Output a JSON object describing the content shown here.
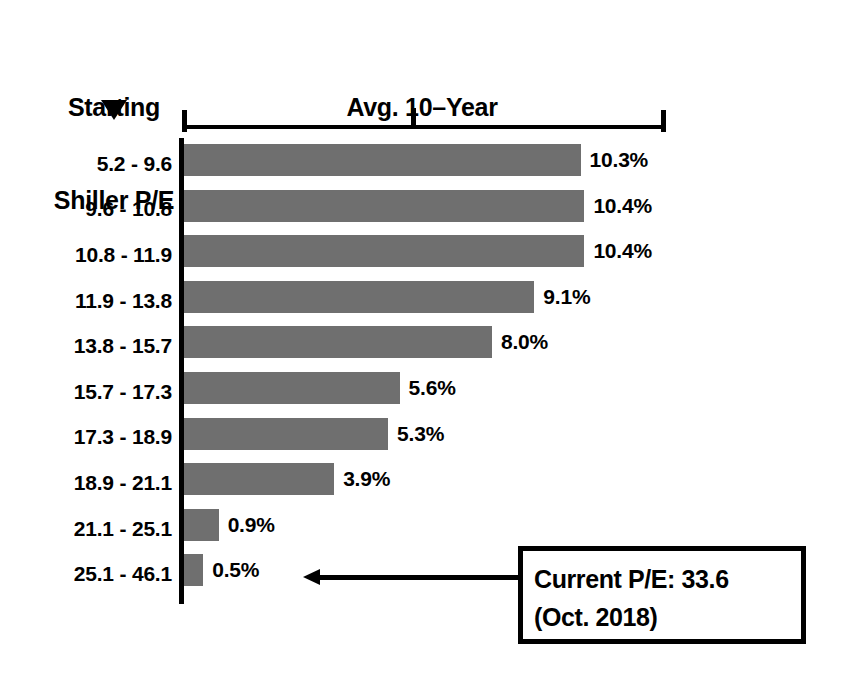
{
  "header": {
    "left_title_line1": "Starting",
    "left_title_line2": "Shiller P/E",
    "right_title_line1": "Avg. 10–Year",
    "right_title_line2": "Real Return",
    "marker_icon": "triangle-down-icon"
  },
  "callout": {
    "line1": "Current P/E: 33.6",
    "line2": "(Oct. 2018)",
    "arrow_icon": "arrow-left-icon"
  },
  "colors": {
    "bar": "#6f6f6f",
    "axis": "#000000",
    "text": "#000000",
    "background": "#ffffff"
  },
  "chart_data": {
    "type": "bar",
    "orientation": "horizontal",
    "title": "Avg. 10–Year Real Return",
    "xlabel": "Avg. 10–Year Real Return",
    "ylabel": "Starting Shiller P/E",
    "categories": [
      "5.2 - 9.6",
      "9.6 - 10.8",
      "10.8 - 11.9",
      "11.9 - 13.8",
      "13.8 - 15.7",
      "15.7 - 17.3",
      "17.3 - 18.9",
      "18.9 - 21.1",
      "21.1 - 25.1",
      "25.1 - 46.1"
    ],
    "values": [
      10.3,
      10.4,
      10.4,
      9.1,
      8.0,
      5.6,
      5.3,
      3.9,
      0.9,
      0.5
    ],
    "value_labels": [
      "10.3%",
      "10.4%",
      "10.4%",
      "9.1%",
      "8.0%",
      "5.6%",
      "5.3%",
      "3.9%",
      "0.9%",
      "0.5%"
    ],
    "xlim": [
      0,
      12.5
    ],
    "xticks": [
      0,
      6.0,
      12.5
    ],
    "xtick_labels": [
      "",
      "",
      ""
    ],
    "grid": false,
    "legend": null,
    "annotations": [
      {
        "text": "Current P/E: 33.6 (Oct. 2018)",
        "points_to_category": "25.1 - 46.1"
      }
    ]
  }
}
